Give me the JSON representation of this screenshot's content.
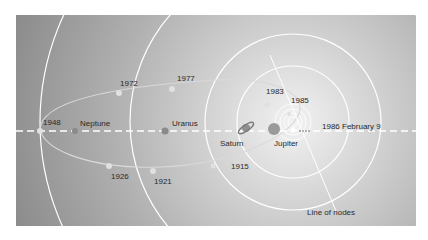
{
  "diagram": {
    "background": {
      "outer": "#8e8e8e",
      "inner": "#e6e6e6"
    },
    "colors": {
      "orbit": "#ffffff",
      "comet_path": "#d9d9d9",
      "label": "#2a2a2a"
    },
    "planets": [
      {
        "name": "Neptune",
        "label": "Neptune"
      },
      {
        "name": "Uranus",
        "label": "Uranus"
      },
      {
        "name": "Saturn",
        "label": "Saturn"
      },
      {
        "name": "Jupiter",
        "label": "Jupiter"
      }
    ],
    "comet_positions": [
      {
        "year": "1948"
      },
      {
        "year": "1972"
      },
      {
        "year": "1977"
      },
      {
        "year": "1983"
      },
      {
        "year": "1985"
      },
      {
        "year": "1986 February 9"
      },
      {
        "year": "1915"
      },
      {
        "year": "1921"
      },
      {
        "year": "1926"
      }
    ],
    "annotations": {
      "line_of_nodes": "Line of nodes"
    }
  }
}
